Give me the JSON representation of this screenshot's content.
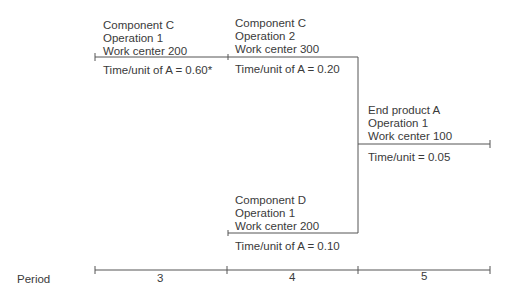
{
  "operations": [
    {
      "id": "comp-c-op1",
      "lines": [
        "Component C",
        "Operation 1",
        "Work center 200"
      ],
      "time": "Time/unit of A = 0.60*"
    },
    {
      "id": "comp-c-op2",
      "lines": [
        "Component C",
        "Operation 2",
        "Work center 300"
      ],
      "time": "Time/unit of A = 0.20"
    },
    {
      "id": "end-a-op1",
      "lines": [
        "End product A",
        "Operation 1",
        "Work center 100"
      ],
      "time": "Time/unit = 0.05"
    },
    {
      "id": "comp-d-op1",
      "lines": [
        "Component D",
        "Operation 1",
        "Work center 200"
      ],
      "time": "Time/unit of A = 0.10"
    }
  ],
  "axis": {
    "label": "Period",
    "periods": [
      "3",
      "4",
      "5"
    ]
  },
  "colors": {
    "line": "#555555",
    "text": "#3a3a3a"
  }
}
